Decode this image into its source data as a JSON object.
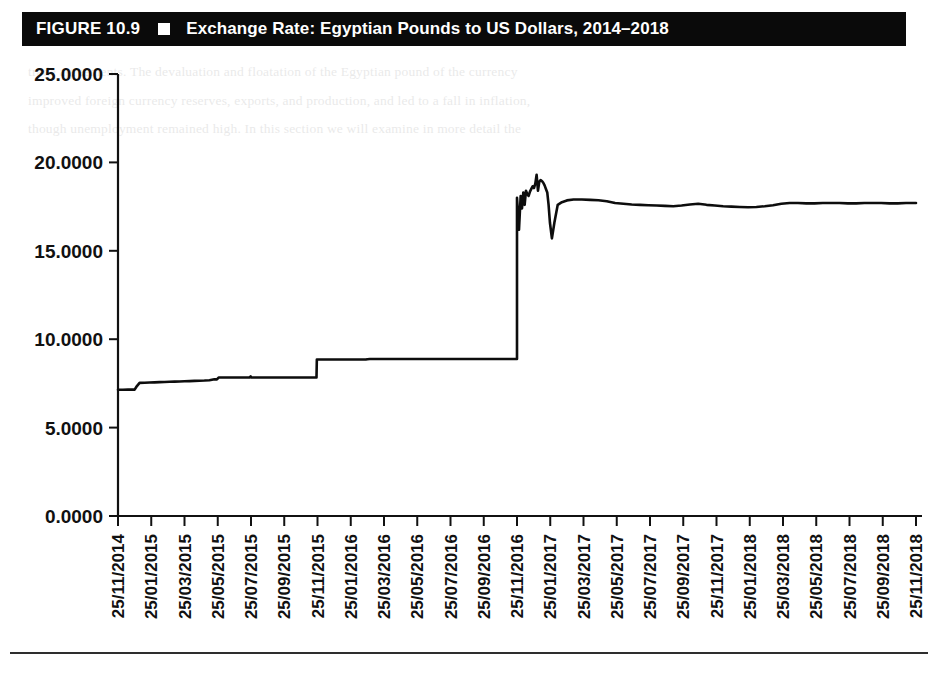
{
  "figure": {
    "label": "FIGURE 10.9",
    "separator_icon": "white-square-bullet",
    "title": "Exchange Rate: Egyptian Pounds to US Dollars, 2014–2018"
  },
  "colors": {
    "bar_background": "#0a0a0a",
    "bar_text": "#ffffff",
    "line": "#0d0d0d",
    "axis": "#111111",
    "page_background": "#ffffff"
  },
  "background_text": {
    "lines": [
      "trade agreements. The devaluation and floatation of the Egyptian pound of the currency",
      "improved foreign currency reserves, exports, and production, and led to a fall in inflation,",
      "though unemployment remained high. In this section we will examine in more detail the"
    ]
  },
  "chart_data": {
    "type": "line",
    "title": "Exchange Rate: Egyptian Pounds to US Dollars, 2014–2018",
    "xlabel": "",
    "ylabel": "",
    "ylim": [
      0.0,
      25.0
    ],
    "yticks": [
      0.0,
      5.0,
      10.0,
      15.0,
      20.0,
      25.0
    ],
    "ytick_labels": [
      "0.0000",
      "5.0000",
      "10.0000",
      "15.0000",
      "20.0000",
      "25.0000"
    ],
    "grid": false,
    "legend": null,
    "xtick_labels": [
      "25/11/2014",
      "25/01/2015",
      "25/03/2015",
      "25/05/2015",
      "25/07/2015",
      "25/09/2015",
      "25/11/2015",
      "25/01/2016",
      "25/03/2016",
      "25/05/2016",
      "25/07/2016",
      "25/09/2016",
      "25/11/2016",
      "25/01/2017",
      "25/03/2017",
      "25/05/2017",
      "25/07/2017",
      "25/09/2017",
      "25/11/2017",
      "25/01/2018",
      "25/03/2018",
      "25/05/2018",
      "25/07/2018",
      "25/09/2018",
      "25/11/2018"
    ],
    "series": [
      {
        "name": "EGP per USD",
        "x": [
          0.0,
          0.3,
          0.6,
          0.9,
          1.0,
          1.1,
          1.3,
          1.6,
          1.9,
          2.2,
          2.5,
          2.8,
          3.1,
          3.4,
          3.7,
          4.0,
          4.3,
          4.6,
          4.9,
          5.2,
          5.5,
          5.8,
          5.95,
          6.05,
          6.2,
          6.5,
          6.8,
          7.1,
          7.4,
          7.7,
          7.9,
          7.98,
          8.02,
          8.3,
          8.6,
          8.9,
          9.2,
          9.5,
          9.8,
          10.1,
          10.4,
          10.7,
          11.0,
          11.3,
          11.6,
          11.85,
          11.94,
          11.96,
          11.98,
          12.0,
          12.03,
          12.06,
          12.09,
          12.12,
          12.15,
          12.18,
          12.21,
          12.25,
          12.3,
          12.38,
          12.46,
          12.55,
          12.65,
          12.75,
          12.85,
          12.95,
          13.02,
          13.08,
          13.12,
          13.18,
          13.25,
          13.32,
          13.4,
          13.5,
          13.6,
          13.7,
          13.8,
          13.88,
          13.94,
          14.0,
          14.06,
          14.12,
          14.18,
          14.24,
          14.3,
          14.38,
          14.48,
          14.58,
          14.66,
          14.74,
          14.82,
          14.9,
          15.0,
          15.15,
          15.35,
          15.6,
          15.9,
          16.2,
          16.5,
          16.8,
          17.1,
          17.4,
          17.7,
          18.0,
          18.3,
          18.6,
          18.9,
          19.2,
          19.5,
          19.8,
          20.1,
          20.4,
          20.7,
          21.0,
          21.3,
          21.6,
          21.9,
          22.2,
          22.5,
          22.8,
          23.1,
          23.4,
          23.7,
          24.0
        ],
        "y": [
          7.14,
          7.14,
          7.15,
          7.15,
          7.15,
          7.3,
          7.53,
          7.54,
          7.55,
          7.56,
          7.57,
          7.58,
          7.59,
          7.6,
          7.61,
          7.62,
          7.63,
          7.64,
          7.65,
          7.66,
          7.68,
          7.73,
          7.73,
          7.83,
          7.83,
          7.83,
          7.83,
          7.83,
          7.83,
          7.83,
          7.83,
          7.9,
          7.83,
          7.83,
          7.83,
          7.83,
          7.83,
          7.83,
          7.83,
          7.83,
          7.83,
          7.83,
          7.83,
          7.83,
          7.83,
          7.83,
          7.84,
          8.85,
          8.85,
          8.85,
          8.85,
          8.85,
          8.85,
          8.85,
          8.85,
          8.85,
          8.85,
          8.85,
          8.85,
          8.85,
          8.85,
          8.85,
          8.85,
          8.85,
          8.85,
          8.85,
          8.85,
          8.85,
          8.85,
          8.85,
          8.85,
          8.85,
          8.85,
          8.85,
          8.85,
          8.85,
          8.85,
          8.85,
          8.85,
          8.85,
          8.85,
          8.85,
          8.85,
          8.85,
          8.85,
          8.85,
          8.85,
          8.85,
          8.85,
          8.85,
          8.85,
          8.85,
          8.87,
          8.88,
          8.88,
          8.88,
          8.88,
          8.88,
          8.88,
          8.88,
          8.88,
          8.88,
          8.88,
          8.88,
          8.88,
          8.88,
          8.88,
          8.88,
          8.88,
          8.88,
          8.88,
          8.88,
          8.88,
          8.88,
          8.88,
          8.88,
          8.88,
          8.88,
          8.88,
          8.88,
          8.88,
          8.88,
          8.88,
          8.88
        ]
      }
    ],
    "annotations": [
      {
        "label": "pre-float managed peg",
        "value_range": [
          7.14,
          8.88
        ]
      },
      {
        "label": "float / devaluation",
        "date": "25/11/2016",
        "from": 8.88,
        "to": 18.0
      },
      {
        "label": "post-float peak",
        "value": 19.3
      },
      {
        "label": "post-float trough",
        "value": 15.7
      },
      {
        "label": "stabilised level",
        "value": 17.7
      }
    ],
    "detail_points": {
      "x": [
        24.0,
        24.12,
        24.22,
        24.3,
        24.38,
        24.46,
        24.54,
        24.62,
        24.7,
        24.78,
        24.86,
        24.94,
        25.02,
        25.1,
        25.18,
        25.26,
        25.34,
        25.42,
        25.5,
        25.58,
        25.66,
        25.74,
        25.82,
        25.9,
        25.98,
        26.1,
        26.25,
        26.45,
        26.7,
        27.0,
        27.4,
        27.9,
        28.4,
        28.9,
        29.4,
        29.9,
        30.4,
        30.9,
        31.4,
        31.9,
        32.4,
        32.9,
        33.4,
        33.9,
        34.4,
        34.9,
        35.4,
        35.9,
        36.4,
        36.9,
        37.4,
        37.9,
        38.4,
        38.9,
        39.4,
        39.9,
        40.4,
        40.9,
        41.4,
        41.9,
        42.4,
        42.9,
        43.4,
        43.9,
        44.4,
        44.9,
        45.4,
        45.9,
        46.4,
        46.9,
        47.4,
        47.9,
        48.0
      ],
      "y": [
        18.0,
        16.2,
        18.1,
        17.4,
        18.3,
        17.6,
        18.4,
        18.2,
        18.1,
        18.35,
        18.5,
        18.65,
        18.55,
        18.8,
        19.3,
        18.4,
        18.9,
        19.0,
        18.95,
        18.85,
        18.7,
        18.5,
        18.3,
        17.6,
        16.6,
        15.7,
        16.6,
        17.6,
        17.75,
        17.85,
        17.9,
        17.9,
        17.88,
        17.86,
        17.8,
        17.7,
        17.66,
        17.62,
        17.6,
        17.58,
        17.56,
        17.54,
        17.52,
        17.56,
        17.62,
        17.66,
        17.6,
        17.56,
        17.52,
        17.5,
        17.48,
        17.46,
        17.48,
        17.52,
        17.58,
        17.66,
        17.7,
        17.7,
        17.68,
        17.68,
        17.7,
        17.7,
        17.7,
        17.68,
        17.68,
        17.7,
        17.7,
        17.7,
        17.68,
        17.68,
        17.7,
        17.7,
        17.7
      ]
    }
  }
}
